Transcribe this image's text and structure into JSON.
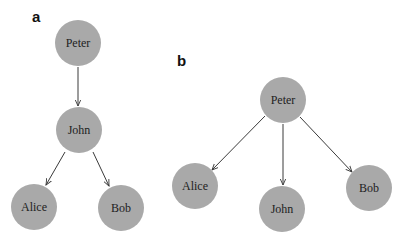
{
  "panels": [
    {
      "label": "a",
      "structure": "chain-then-branch",
      "nodes": [
        {
          "id": "peter",
          "label": "Peter",
          "cx": 78,
          "cy": 43
        },
        {
          "id": "john",
          "label": "John",
          "cx": 79,
          "cy": 130
        },
        {
          "id": "alice",
          "label": "Alice",
          "cx": 34,
          "cy": 207
        },
        {
          "id": "bob",
          "label": "Bob",
          "cx": 121,
          "cy": 208
        }
      ],
      "edges": [
        {
          "from": "Peter",
          "to": "John"
        },
        {
          "from": "John",
          "to": "Alice"
        },
        {
          "from": "John",
          "to": "Bob"
        }
      ]
    },
    {
      "label": "b",
      "structure": "star",
      "nodes": [
        {
          "id": "peter",
          "label": "Peter",
          "cx": 283,
          "cy": 100
        },
        {
          "id": "alice",
          "label": "Alice",
          "cx": 195,
          "cy": 186
        },
        {
          "id": "john",
          "label": "John",
          "cx": 282,
          "cy": 209
        },
        {
          "id": "bob",
          "label": "Bob",
          "cx": 369,
          "cy": 188
        }
      ],
      "edges": [
        {
          "from": "Peter",
          "to": "Alice"
        },
        {
          "from": "Peter",
          "to": "John"
        },
        {
          "from": "Peter",
          "to": "Bob"
        }
      ]
    }
  ],
  "style": {
    "node_fill": "#a9a9a9",
    "edge_color": "#3a3a3a",
    "text_color": "#222222",
    "node_radius": 23
  }
}
